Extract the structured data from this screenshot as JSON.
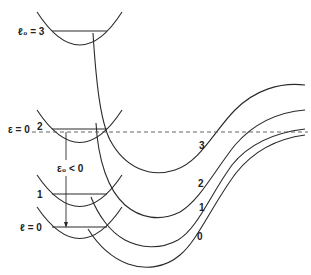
{
  "diagram": {
    "left_parabolas": [
      {
        "label": "ℓ₀ = 3",
        "level_label": "l0=3"
      },
      {
        "label": "ε = 0",
        "level_label": "2"
      },
      {
        "label": "1",
        "level_label": "1"
      },
      {
        "label": "ℓ = 0",
        "level_label": "0"
      }
    ],
    "labels": {
      "l0_eq_3": "ℓ₀ = 3",
      "epsilon_eq_0": "ε = 0",
      "level_2": "2",
      "epsilon0_lt_0": "ε₀ < 0",
      "level_1": "1",
      "l_eq_0": "ℓ = 0",
      "curve_3": "3",
      "curve_2": "2",
      "curve_1": "1",
      "curve_0": "0"
    },
    "colors": {
      "line": "#2a2a2a",
      "dashed": "#555555",
      "background": "#ffffff"
    }
  }
}
